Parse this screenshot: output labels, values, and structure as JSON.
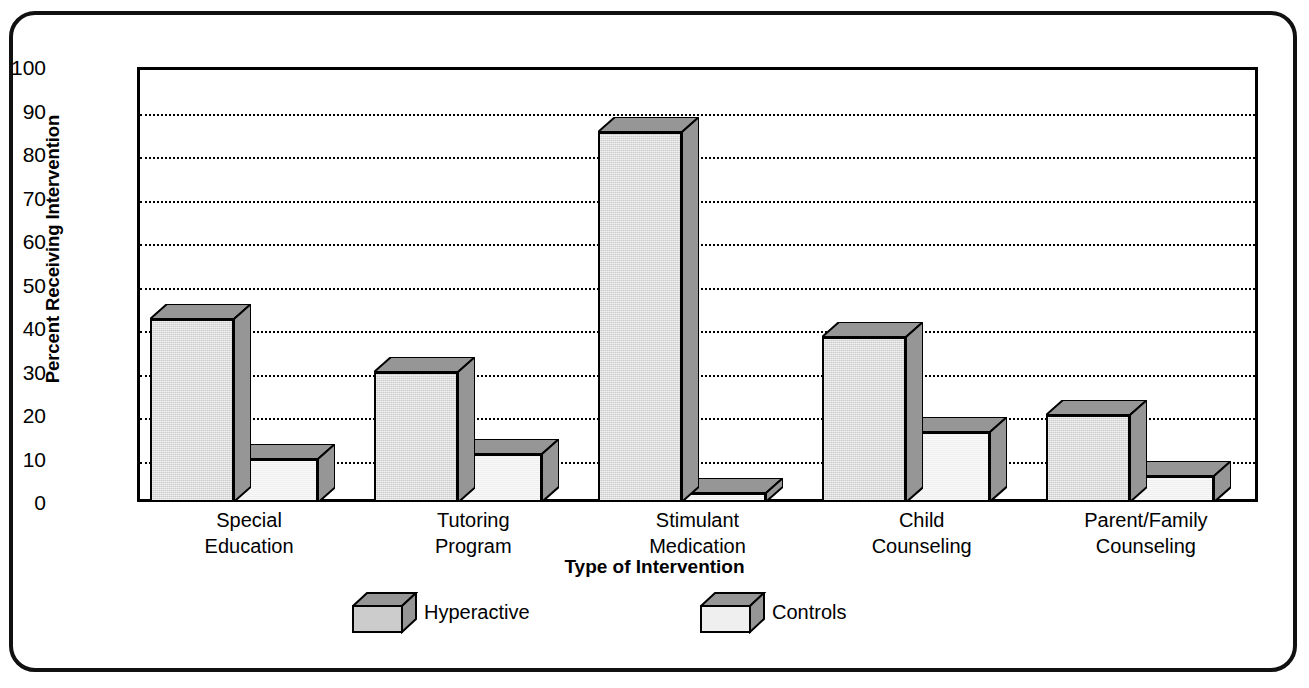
{
  "chart_data": {
    "type": "bar",
    "title": "",
    "subtitle": "",
    "xlabel": "Type of Intervention",
    "ylabel": "Percent Receiving Intervention",
    "ylim": [
      0,
      100
    ],
    "ytick_step": 10,
    "yticks": [
      100,
      90,
      80,
      70,
      60,
      50,
      40,
      30,
      20,
      10,
      0
    ],
    "gridlines": [
      90,
      80,
      70,
      60,
      50,
      40,
      30,
      20,
      10
    ],
    "grid": true,
    "grid_style": "dotted-horizontal",
    "legend_position": "bottom",
    "style": "3d-bars",
    "categories": [
      "Special Education",
      "Tutoring Program",
      "Stimulant Medication",
      "Child Counseling",
      "Parent/Family Counseling"
    ],
    "category_lines": [
      [
        "Special",
        "Education"
      ],
      [
        "Tutoring",
        "Program"
      ],
      [
        "Stimulant",
        "Medication"
      ],
      [
        "Child",
        "Counseling"
      ],
      [
        "Parent/Family",
        "Counseling"
      ]
    ],
    "series": [
      {
        "name": "Hyperactive",
        "values": [
          42,
          30,
          85,
          38,
          20
        ],
        "face_color": "#cccccc",
        "shade_color": "#969696"
      },
      {
        "name": "Controls",
        "values": [
          10,
          11,
          2,
          16,
          6
        ],
        "face_color": "#efefef",
        "shade_color": "#969696"
      }
    ]
  },
  "axes": {
    "y_title": "Percent Receiving Intervention",
    "x_title": "Type of Intervention",
    "y_tick_labels": [
      "100",
      "90",
      "80",
      "70",
      "60",
      "50",
      "40",
      "30",
      "20",
      "10",
      "0"
    ],
    "x_tick_labels": [
      {
        "line1": "Special",
        "line2": "Education"
      },
      {
        "line1": "Tutoring",
        "line2": "Program"
      },
      {
        "line1": "Stimulant",
        "line2": "Medication"
      },
      {
        "line1": "Child",
        "line2": "Counseling"
      },
      {
        "line1": "Parent/Family",
        "line2": "Counseling"
      }
    ]
  },
  "legend": {
    "entries": [
      {
        "label": "Hyperactive"
      },
      {
        "label": "Controls"
      }
    ]
  },
  "colors": {
    "frame": "#111111",
    "axis": "#000000",
    "grid": "#000000",
    "background": "#ffffff",
    "hyperactive_face": "#cccccc",
    "hyperactive_shade": "#969696",
    "controls_face": "#efefef",
    "controls_shade": "#969696"
  }
}
